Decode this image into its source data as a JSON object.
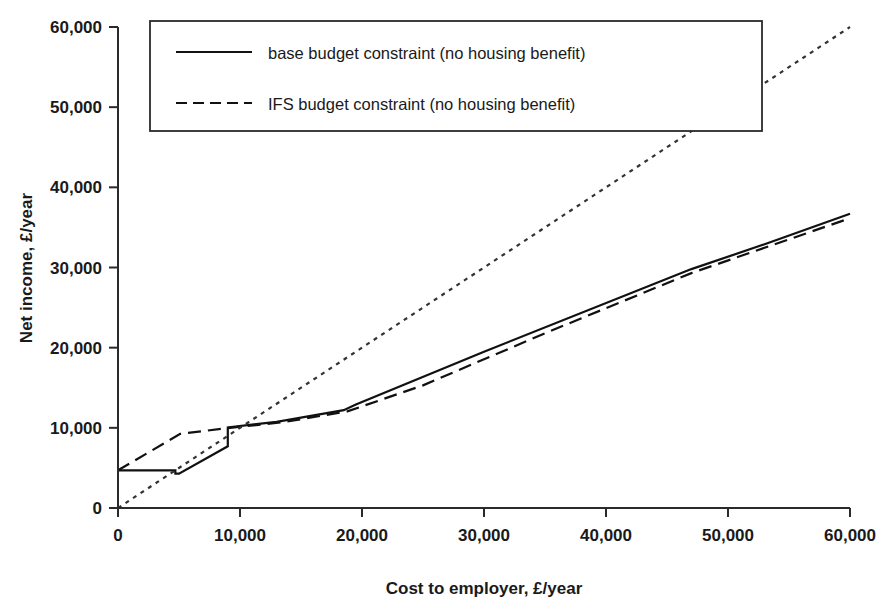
{
  "chart_data": {
    "type": "line",
    "title": "",
    "xlabel": "Cost to employer, £/year",
    "ylabel": "Net income, £/year",
    "xlim": [
      0,
      60000
    ],
    "ylim": [
      0,
      60000
    ],
    "xticks": [
      0,
      10000,
      20000,
      30000,
      40000,
      50000,
      60000
    ],
    "yticks": [
      0,
      10000,
      20000,
      30000,
      40000,
      50000,
      60000
    ],
    "xticklabels": [
      "0",
      "10,000",
      "20,000",
      "30,000",
      "40,000",
      "50,000",
      "60,000"
    ],
    "yticklabels": [
      "0",
      "10,000",
      "20,000",
      "30,000",
      "40,000",
      "50,000",
      "60,000"
    ],
    "grid": false,
    "legend_position": "upper-left",
    "series": [
      {
        "name": "base budget constraint (no housing benefit)",
        "style": "solid",
        "color": "#111111",
        "points": [
          [
            0,
            4700
          ],
          [
            4700,
            4700
          ],
          [
            4700,
            4280
          ],
          [
            5000,
            4280
          ],
          [
            9000,
            7700
          ],
          [
            9000,
            10050
          ],
          [
            13000,
            10750
          ],
          [
            18500,
            12200
          ],
          [
            19500,
            12900
          ],
          [
            30000,
            19500
          ],
          [
            47000,
            29800
          ],
          [
            53000,
            32900
          ],
          [
            60000,
            36700
          ]
        ]
      },
      {
        "name": "IFS budget constraint (no housing benefit)",
        "style": "dashed",
        "color": "#111111",
        "points": [
          [
            0,
            4700
          ],
          [
            5100,
            9250
          ],
          [
            9200,
            10000
          ],
          [
            13500,
            10700
          ],
          [
            18800,
            12050
          ],
          [
            25000,
            15300
          ],
          [
            35000,
            21800
          ],
          [
            47000,
            29300
          ],
          [
            60000,
            36150
          ]
        ]
      },
      {
        "name": "45-degree reference line",
        "style": "dotted",
        "color": "#333333",
        "points": [
          [
            0,
            0
          ],
          [
            60000,
            60000
          ]
        ]
      }
    ],
    "legend_entries": [
      {
        "label": "base budget constraint (no housing benefit)",
        "style": "solid"
      },
      {
        "label": "IFS budget constraint (no housing benefit)",
        "style": "dashed"
      }
    ]
  }
}
